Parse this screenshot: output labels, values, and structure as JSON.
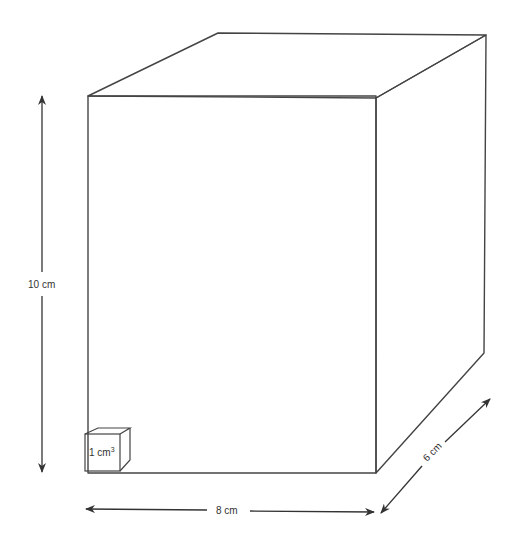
{
  "diagram": {
    "type": "rectangular-prism",
    "colors": {
      "stroke": "#444444",
      "arrow": "#333333",
      "background": "#ffffff"
    },
    "dimensions": {
      "height": {
        "label": "10 cm"
      },
      "width": {
        "label": "8 cm"
      },
      "depth": {
        "label": "6 cm"
      }
    },
    "unit_cube": {
      "label": "1 cm",
      "superscript": "3"
    }
  }
}
